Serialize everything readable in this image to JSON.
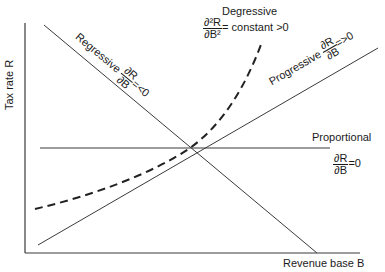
{
  "diagram": {
    "axes": {
      "y_label": "Tax rate R",
      "x_label": "Revenue base B"
    },
    "curves": {
      "regressive": {
        "name": "Regressive",
        "num": "∂R",
        "den": "∂B",
        "condition": "=<0"
      },
      "progressive": {
        "name": "Progressive",
        "num": "∂R",
        "den": "∂B",
        "condition": "=>0"
      },
      "proportional": {
        "name": "Proportional",
        "num": "∂R",
        "den": "∂B",
        "condition": "=0"
      },
      "degressive": {
        "name": "Degressive",
        "num": "∂²R",
        "den": "∂B²",
        "condition": "= constant >0"
      }
    },
    "colors": {
      "line": "#3a3a3a",
      "text": "#1a1a1a",
      "background": "#ffffff"
    }
  }
}
